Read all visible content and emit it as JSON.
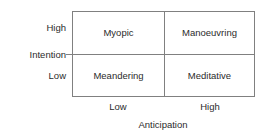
{
  "figure": {
    "type": "2x2-matrix",
    "line_color": "#808080",
    "text_color": "#2b2b2b",
    "background_color": "#ffffff"
  },
  "y_axis": {
    "title": "Intention",
    "high_label": "High",
    "low_label": "Low"
  },
  "x_axis": {
    "title": "Anticipation",
    "low_label": "Low",
    "high_label": "High"
  },
  "quadrants": {
    "top_left": "Myopic",
    "top_right": "Manoeuvring",
    "bottom_left": "Meandering",
    "bottom_right": "Meditative"
  },
  "chart_data": {
    "type": "table",
    "title": "",
    "xlabel": "Anticipation",
    "ylabel": "Intention",
    "x_categories": [
      "Low",
      "High"
    ],
    "y_categories": [
      "High",
      "Low"
    ],
    "cells": [
      [
        "Myopic",
        "Manoeuvring"
      ],
      [
        "Meandering",
        "Meditative"
      ]
    ],
    "grid": true,
    "legend": "none"
  }
}
